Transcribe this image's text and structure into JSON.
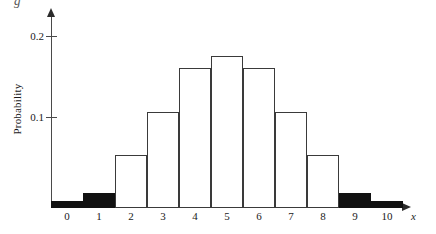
{
  "chart_data": {
    "type": "bar",
    "title": "",
    "subtitle": "",
    "xlabel": "x",
    "ylabel": "Probability",
    "categories": [
      "0",
      "1",
      "2",
      "3",
      "4",
      "5",
      "6",
      "7",
      "8",
      "9",
      "10"
    ],
    "values": [
      0.008,
      0.016,
      0.058,
      0.105,
      0.154,
      0.167,
      0.154,
      0.105,
      0.058,
      0.016,
      0.008
    ],
    "bar_styles": [
      "filled",
      "filled",
      "open",
      "open",
      "open",
      "open",
      "open",
      "open",
      "open",
      "filled",
      "filled"
    ],
    "ylim": [
      0,
      0.215
    ],
    "xlim": [
      -0.5,
      10.5
    ],
    "y_ticks": [
      0.1,
      0.2
    ],
    "y_tick_labels": [
      "0.1",
      "0.2"
    ],
    "x_tick_labels": [
      "0",
      "1",
      "2",
      "3",
      "4",
      "5",
      "6",
      "7",
      "8",
      "9",
      "10"
    ],
    "grid": false,
    "legend": "none",
    "axis_arrows": true,
    "colors": {
      "bar_fill_open": "#ffffff",
      "bar_fill_shaded": "#111111",
      "bar_stroke": "#3a3a3a",
      "axis": "#4a4a4a",
      "text": "#1a1a1a"
    },
    "annotations": []
  },
  "axes": {
    "y_title": "Probability",
    "x_title": "x",
    "y_tick_0": "0.1",
    "y_tick_1": "0.2"
  },
  "top_fragment": {
    "text": "g"
  }
}
